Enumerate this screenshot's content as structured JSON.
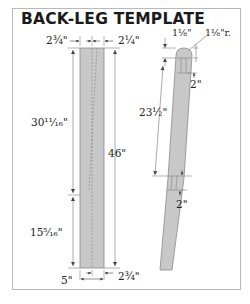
{
  "title": "BACK-LEG TEMPLATE",
  "front_view": {
    "dims": {
      "top_left_width": "2¾\"",
      "top_right_width": "2¼\"",
      "upper_length": "30¹¹⁄₁₆\"",
      "overall_length": "46\"",
      "lower_length": "15⁵⁄₁₆\"",
      "bottom_left": "5\"",
      "bottom_right": "2¾\""
    }
  },
  "side_view": {
    "dims": {
      "top_thickness": "1⅛\"",
      "top_radius": "1⅛\"r.",
      "top_mortise": "2\"",
      "mid_length": "23½\"",
      "lower_mortise": "2\""
    }
  },
  "colors": {
    "part_fill": "#c8c8c8",
    "part_stroke": "#8a8a8a",
    "dim_line": "#555555",
    "frame_border": "#b9b9b9"
  }
}
